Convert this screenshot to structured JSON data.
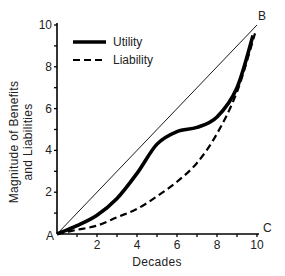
{
  "chart_data": {
    "type": "line",
    "title": "",
    "xlabel": "Decades",
    "ylabel": "Magnitude of Benefits and Liabilities",
    "ylabel_lines": [
      "Magnitude of Benefits",
      "and Liabilities"
    ],
    "xlim": [
      0,
      10
    ],
    "ylim": [
      0,
      10
    ],
    "x_ticks": [
      2,
      4,
      6,
      8,
      10
    ],
    "y_ticks": [
      2,
      4,
      6,
      8,
      10
    ],
    "x_minor_ticks": [
      1,
      3,
      5,
      7,
      9
    ],
    "y_minor_ticks": [
      1,
      3,
      5,
      7,
      9
    ],
    "grid": false,
    "legend_position": "upper-left",
    "annotations": [
      {
        "text": "A",
        "x": 0,
        "y": 0
      },
      {
        "text": "B",
        "x": 10,
        "y": 10
      },
      {
        "text": "C",
        "x": 10,
        "y": 0
      }
    ],
    "reference_line": {
      "name": "A-B diagonal",
      "x": [
        0,
        10
      ],
      "y": [
        0,
        10
      ],
      "style": "thin solid"
    },
    "series": [
      {
        "name": "Utility",
        "style": "thick solid",
        "x": [
          0,
          1,
          2,
          3,
          4,
          5,
          6,
          7,
          8,
          9,
          9.8
        ],
        "values": [
          0,
          0.4,
          0.9,
          1.7,
          2.9,
          4.3,
          4.9,
          5.1,
          5.6,
          7.0,
          9.5
        ]
      },
      {
        "name": "Liability",
        "style": "dashed",
        "x": [
          0,
          1,
          2,
          3,
          4,
          5,
          6,
          7,
          8,
          9,
          9.9
        ],
        "values": [
          0,
          0.2,
          0.4,
          0.8,
          1.2,
          1.8,
          2.5,
          3.4,
          4.8,
          6.8,
          9.6
        ]
      }
    ]
  },
  "legend": {
    "items": [
      {
        "label": "Utility",
        "style": "solid"
      },
      {
        "label": "Liability",
        "style": "dashed"
      }
    ]
  },
  "colors": {
    "line": "#000000",
    "text": "#222222",
    "background": "#ffffff"
  }
}
